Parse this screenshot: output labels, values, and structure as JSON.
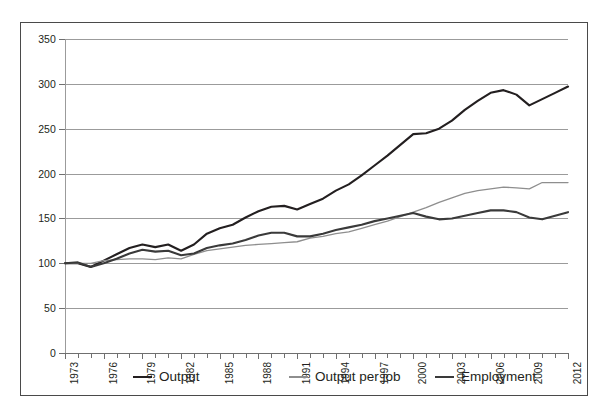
{
  "chart_data": {
    "type": "line",
    "title": "",
    "subtitle": "",
    "xlabel": "",
    "ylabel": "",
    "grid": true,
    "legend_position": "bottom",
    "xlim": [
      1973,
      2012
    ],
    "ylim": [
      0,
      350
    ],
    "ytick_step": 50,
    "yticks": [
      0,
      50,
      100,
      150,
      200,
      250,
      300,
      350
    ],
    "xtick_labels": [
      "1973",
      "1976",
      "1979",
      "1982",
      "1985",
      "1988",
      "1991",
      "1994",
      "1997",
      "2000",
      "2003",
      "2006",
      "2009",
      "2012"
    ],
    "x": [
      1973,
      1974,
      1975,
      1976,
      1977,
      1978,
      1979,
      1980,
      1981,
      1982,
      1983,
      1984,
      1985,
      1986,
      1987,
      1988,
      1989,
      1990,
      1991,
      1992,
      1993,
      1994,
      1995,
      1996,
      1997,
      1998,
      1999,
      2000,
      2001,
      2002,
      2003,
      2004,
      2005,
      2006,
      2007,
      2008,
      2009,
      2010,
      2011,
      2012
    ],
    "series": [
      {
        "name": "Output",
        "color": "#231f20",
        "width": 2.1,
        "values": [
          100,
          100,
          96,
          103,
          110,
          117,
          121,
          118,
          121,
          114,
          121,
          133,
          139,
          143,
          151,
          158,
          163,
          164,
          160,
          166,
          172,
          181,
          188,
          198,
          209,
          220,
          232,
          244,
          245,
          250,
          259,
          271,
          281,
          290,
          293,
          288,
          276,
          283,
          290,
          297
        ]
      },
      {
        "name": "Output per job",
        "color": "#8e8e8e",
        "width": 1.3,
        "values": [
          100,
          100,
          100,
          103,
          104,
          105,
          105,
          104,
          106,
          105,
          110,
          114,
          116,
          118,
          120,
          121,
          122,
          123,
          124,
          128,
          130,
          133,
          135,
          139,
          143,
          147,
          152,
          157,
          162,
          168,
          173,
          178,
          181,
          183,
          185,
          184,
          183,
          190,
          190,
          190
        ]
      },
      {
        "name": "Employment",
        "color": "#3a3a3a",
        "width": 2.1,
        "values": [
          100,
          101,
          96,
          100,
          105,
          111,
          115,
          113,
          114,
          109,
          111,
          117,
          120,
          122,
          126,
          131,
          134,
          134,
          130,
          130,
          133,
          137,
          140,
          143,
          147,
          150,
          153,
          156,
          152,
          149,
          150,
          153,
          156,
          159,
          159,
          157,
          151,
          149,
          153,
          157
        ]
      }
    ],
    "legend": [
      {
        "label": "Output",
        "color": "#231f20",
        "width": 2.1
      },
      {
        "label": "Output per job",
        "color": "#8e8e8e",
        "width": 1.3
      },
      {
        "label": "Employment",
        "color": "#3a3a3a",
        "width": 2.6
      }
    ]
  }
}
